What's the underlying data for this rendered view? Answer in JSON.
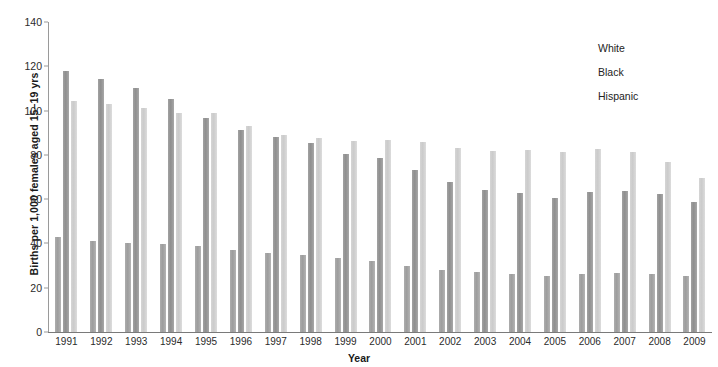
{
  "chart_data": {
    "type": "bar",
    "title": "",
    "xlabel": "Year",
    "ylabel": "Births per 1,000 females aged 15–19 yrs",
    "ylim": [
      0,
      140
    ],
    "yticks": [
      0,
      20,
      40,
      60,
      80,
      100,
      120,
      140
    ],
    "grid": false,
    "legend_position": "top-right",
    "categories": [
      "1991",
      "1992",
      "1993",
      "1994",
      "1995",
      "1996",
      "1997",
      "1998",
      "1999",
      "2000",
      "2001",
      "2002",
      "2003",
      "2004",
      "2005",
      "2006",
      "2007",
      "2008",
      "2009"
    ],
    "series": [
      {
        "name": "White",
        "color": "#a3a3a3",
        "values": [
          43.4,
          41.7,
          40.7,
          40.4,
          39.3,
          37.6,
          36.0,
          35.3,
          34.1,
          32.6,
          30.3,
          28.5,
          27.5,
          26.7,
          25.9,
          26.6,
          27.2,
          26.7,
          25.6
        ]
      },
      {
        "name": "Black",
        "color": "#959595",
        "values": [
          118.2,
          114.7,
          110.5,
          105.7,
          97.2,
          91.7,
          88.3,
          85.7,
          81.0,
          79.2,
          73.5,
          68.3,
          64.8,
          63.1,
          60.9,
          63.7,
          64.3,
          62.9,
          59.0
        ]
      },
      {
        "name": "Hispanic",
        "color": "#d2d2d2",
        "values": [
          104.6,
          103.3,
          101.8,
          99.3,
          99.3,
          93.6,
          89.6,
          87.9,
          86.8,
          87.3,
          86.4,
          83.4,
          82.3,
          82.6,
          81.7,
          83.0,
          81.7,
          77.4,
          70.1
        ]
      }
    ]
  },
  "legend": {
    "items": [
      {
        "label": "White",
        "swatch_class": "white-ser"
      },
      {
        "label": "Black",
        "swatch_class": "black-ser"
      },
      {
        "label": "Hispanic",
        "swatch_class": "hisp-ser"
      }
    ]
  }
}
